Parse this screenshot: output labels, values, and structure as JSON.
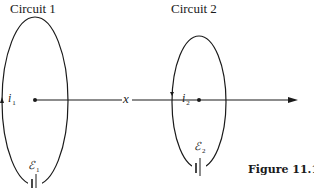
{
  "figure": {
    "caption": "Figure 11.11",
    "circuits": [
      {
        "title": "Circuit 1",
        "current_symbol": "i",
        "current_sub": "1",
        "emf_symbol": "ℰ",
        "emf_sub": "1"
      },
      {
        "title": "Circuit 2",
        "current_symbol": "i",
        "current_sub": "2",
        "emf_symbol": "ℰ",
        "emf_sub": "2"
      }
    ],
    "axis_label": "x",
    "colors": {
      "ink": "#1a1a1a",
      "background": "#ffffff"
    }
  }
}
